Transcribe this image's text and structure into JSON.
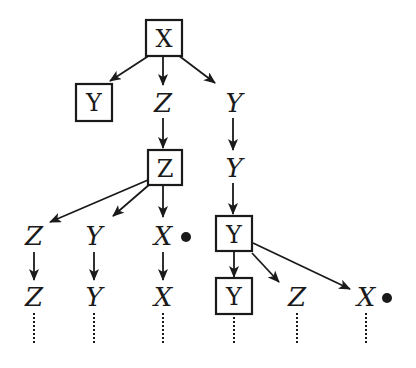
{
  "diagram": {
    "type": "search-tree",
    "nodes": [
      {
        "id": "n1",
        "label": "X",
        "boxed": true,
        "x": 163,
        "y": 38
      },
      {
        "id": "n2",
        "label": "Y",
        "boxed": true,
        "x": 94,
        "y": 102
      },
      {
        "id": "n3",
        "label": "Z",
        "boxed": false,
        "x": 163,
        "y": 103
      },
      {
        "id": "n4",
        "label": "Y",
        "boxed": false,
        "x": 233,
        "y": 103
      },
      {
        "id": "n5",
        "label": "Z",
        "boxed": true,
        "x": 165,
        "y": 168
      },
      {
        "id": "n6",
        "label": "Y",
        "boxed": false,
        "x": 233,
        "y": 168
      },
      {
        "id": "n7",
        "label": "Z",
        "boxed": false,
        "x": 34,
        "y": 236
      },
      {
        "id": "n8",
        "label": "Y",
        "boxed": false,
        "x": 94,
        "y": 236
      },
      {
        "id": "n9",
        "label": "X",
        "boxed": false,
        "x": 163,
        "y": 236,
        "marked": true
      },
      {
        "id": "n10",
        "label": "Y",
        "boxed": true,
        "x": 234,
        "y": 234
      },
      {
        "id": "n11",
        "label": "Z",
        "boxed": false,
        "x": 34,
        "y": 297
      },
      {
        "id": "n12",
        "label": "Y",
        "boxed": false,
        "x": 94,
        "y": 297
      },
      {
        "id": "n13",
        "label": "X",
        "boxed": false,
        "x": 163,
        "y": 297
      },
      {
        "id": "n14",
        "label": "Y",
        "boxed": true,
        "x": 234,
        "y": 296
      },
      {
        "id": "n15",
        "label": "Z",
        "boxed": false,
        "x": 297,
        "y": 297
      },
      {
        "id": "n16",
        "label": "X",
        "boxed": false,
        "x": 366,
        "y": 297,
        "marked": true
      }
    ],
    "edges": [
      {
        "from": "n1",
        "to": "n2"
      },
      {
        "from": "n1",
        "to": "n3"
      },
      {
        "from": "n1",
        "to": "n4"
      },
      {
        "from": "n3",
        "to": "n5"
      },
      {
        "from": "n4",
        "to": "n6"
      },
      {
        "from": "n6",
        "to": "n10"
      },
      {
        "from": "n5",
        "to": "n7"
      },
      {
        "from": "n5",
        "to": "n8"
      },
      {
        "from": "n5",
        "to": "n9"
      },
      {
        "from": "n7",
        "to": "n11"
      },
      {
        "from": "n8",
        "to": "n12"
      },
      {
        "from": "n9",
        "to": "n13"
      },
      {
        "from": "n10",
        "to": "n14"
      },
      {
        "from": "n10",
        "to": "n15"
      },
      {
        "from": "n10",
        "to": "n16"
      }
    ],
    "continuations": [
      "n11",
      "n12",
      "n13",
      "n14",
      "n15",
      "n16"
    ],
    "marker_symbol": "●"
  }
}
